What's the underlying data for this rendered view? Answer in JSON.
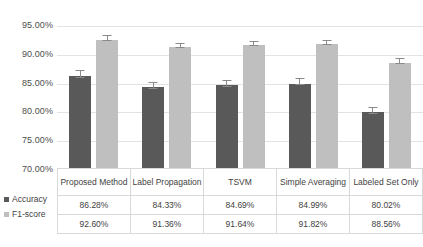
{
  "chart_data": {
    "type": "bar",
    "title": "",
    "xlabel": "",
    "ylabel": "",
    "ylim": [
      70.0,
      95.0
    ],
    "ytick_labels": [
      "95.00%",
      "90.00%",
      "85.00%",
      "80.00%",
      "75.00%",
      "70.00%"
    ],
    "ytick_values": [
      95.0,
      90.0,
      85.0,
      80.0,
      75.0,
      70.0
    ],
    "grid": true,
    "legend_position": "bottom-left",
    "categories": [
      "Proposed Method",
      "Label Propagation",
      "TSVM",
      "Simple Averaging",
      "Labeled Set Only"
    ],
    "series": [
      {
        "name": "Accuracy",
        "color": "#595959",
        "values": [
          86.28,
          84.33,
          84.69,
          84.99,
          80.02
        ],
        "labels": [
          "86.28%",
          "84.33%",
          "84.69%",
          "84.99%",
          "80.02%"
        ],
        "errors": [
          1.0,
          0.9,
          1.0,
          0.9,
          1.0
        ]
      },
      {
        "name": "F1-score",
        "color": "#bfbfbf",
        "values": [
          92.6,
          91.36,
          91.64,
          91.82,
          88.56
        ],
        "labels": [
          "92.60%",
          "91.36%",
          "91.64%",
          "91.82%",
          "88.56%"
        ],
        "errors": [
          0.8,
          0.7,
          0.8,
          0.8,
          0.8
        ]
      }
    ]
  },
  "table": {
    "header_row": [
      "Proposed Method",
      "Label Propagation",
      "TSVM",
      "Simple Averaging",
      "Labeled Set Only"
    ],
    "rows": [
      {
        "label": "Accuracy",
        "swatch": "accuracy-swatch",
        "cells": [
          "86.28%",
          "84.33%",
          "84.69%",
          "84.99%",
          "80.02%"
        ]
      },
      {
        "label": "F1-score",
        "swatch": "f1-swatch",
        "cells": [
          "92.60%",
          "91.36%",
          "91.64%",
          "91.82%",
          "88.56%"
        ]
      }
    ]
  },
  "colors": {
    "accuracy": "#595959",
    "f1": "#bfbfbf",
    "gridline": "#e3e3e3",
    "table_border": "#d9d9d9",
    "text": "#404040"
  }
}
